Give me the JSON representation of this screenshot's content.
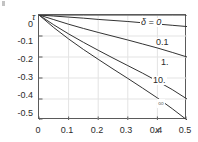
{
  "chart_data": {
    "type": "line",
    "title": "",
    "subtitle": "",
    "xlabel": "x",
    "ylabel": "τ",
    "xlim": [
      0,
      0.5
    ],
    "ylim": [
      -0.5,
      0.0
    ],
    "grid": true,
    "legend_position": "inline-right-of-curves",
    "x_ticks": [
      "0",
      "0.1",
      "0.2",
      "0.3",
      "0.4",
      "0.5"
    ],
    "x_tick_values": [
      0,
      0.1,
      0.2,
      0.3,
      0.4,
      0.5
    ],
    "y_ticks": [
      "0",
      "-0.1",
      "-0.2",
      "-0.3",
      "-0.4",
      "-0.5"
    ],
    "y_tick_values": [
      0,
      -0.1,
      -0.2,
      -0.3,
      -0.4,
      -0.5
    ],
    "x": [
      0,
      0.05,
      0.1,
      0.15,
      0.2,
      0.25,
      0.3,
      0.35,
      0.4,
      0.45,
      0.5
    ],
    "series": [
      {
        "name": "δ = 0",
        "label": "δ = 0",
        "color": "#333333",
        "values": [
          0,
          0,
          0,
          0,
          0,
          0,
          0,
          0,
          0,
          0,
          0
        ]
      },
      {
        "name": "0.1",
        "label": "0.1",
        "color": "#333333",
        "values": [
          0,
          -0.005,
          -0.01,
          -0.015,
          -0.021,
          -0.026,
          -0.031,
          -0.037,
          -0.043,
          -0.049,
          -0.055
        ]
      },
      {
        "name": "1.",
        "label": "1.",
        "color": "#333333",
        "values": [
          0,
          -0.022,
          -0.044,
          -0.064,
          -0.083,
          -0.101,
          -0.119,
          -0.138,
          -0.157,
          -0.178,
          -0.2
        ]
      },
      {
        "name": "10.",
        "label": "10.",
        "color": "#333333",
        "values": [
          0,
          -0.047,
          -0.09,
          -0.13,
          -0.168,
          -0.205,
          -0.241,
          -0.277,
          -0.315,
          -0.355,
          -0.4
        ]
      },
      {
        "name": "∞",
        "label": "∞",
        "color": "#333333",
        "values": [
          0,
          -0.06,
          -0.114,
          -0.164,
          -0.211,
          -0.257,
          -0.302,
          -0.348,
          -0.395,
          -0.446,
          -0.5
        ]
      }
    ]
  },
  "axes": {
    "y_axis_title": "τ",
    "x_axis_title": "x"
  },
  "labels": {
    "delta_zero": "δ = 0",
    "zero_one": "0.1",
    "one": "1.",
    "ten": "10.",
    "infinity": "∞"
  },
  "colors": {
    "curve": "#333333",
    "frame": "#5a5a5a",
    "grid": "#e3e3e3",
    "text": "#2b2b2b",
    "background": "#ffffff"
  }
}
